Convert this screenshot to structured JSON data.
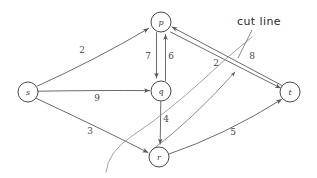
{
  "diagram": {
    "background_color": "#ffffff",
    "stroke_color": "#5a5a5a",
    "label_color": "#3a3a3a"
  },
  "nodes": [
    {
      "id": "s",
      "label": "s",
      "cx": 28,
      "cy": 92,
      "r": 10
    },
    {
      "id": "p",
      "label": "p",
      "cx": 161,
      "cy": 22,
      "r": 10
    },
    {
      "id": "q",
      "label": "q",
      "cx": 161,
      "cy": 91,
      "r": 10
    },
    {
      "id": "r",
      "label": "r",
      "cx": 159,
      "cy": 157,
      "r": 10
    },
    {
      "id": "t",
      "label": "t",
      "cx": 290,
      "cy": 92,
      "r": 10
    }
  ],
  "edges": [
    {
      "id": "s-p",
      "from": "s",
      "to": "p",
      "weight": "2",
      "label_x": 82,
      "label_y": 50
    },
    {
      "id": "s-q",
      "from": "s",
      "to": "q",
      "weight": "9",
      "label_x": 97,
      "label_y": 98
    },
    {
      "id": "s-r",
      "from": "s",
      "to": "r",
      "weight": "3",
      "label_x": 90,
      "label_y": 131
    },
    {
      "id": "p-q",
      "from": "p",
      "to": "q",
      "weight": "7",
      "label_x": 148,
      "label_y": 56
    },
    {
      "id": "q-p",
      "from": "q",
      "to": "p",
      "weight": "6",
      "label_x": 171,
      "label_y": 56
    },
    {
      "id": "q-r",
      "from": "q",
      "to": "r",
      "weight": "4",
      "label_x": 166,
      "label_y": 119
    },
    {
      "id": "r-p",
      "from": "r",
      "to": "p",
      "weight": "2",
      "label_x": 216,
      "label_y": 63
    },
    {
      "id": "t-p",
      "from": "t",
      "to": "p",
      "weight": "8",
      "label_x": 252,
      "label_y": 56
    },
    {
      "id": "p-t",
      "from": "p",
      "to": "t",
      "weight": "",
      "label_x": 0,
      "label_y": 0
    },
    {
      "id": "r-t",
      "from": "r",
      "to": "t",
      "weight": "5",
      "label_x": 233,
      "label_y": 132
    }
  ],
  "annotations": [
    {
      "id": "cut-line",
      "text": "cut line",
      "x": 259,
      "y": 22
    }
  ]
}
